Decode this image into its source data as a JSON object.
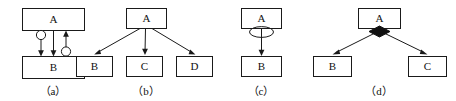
{
  "figure": {
    "background": "#ffffff",
    "stroke_color": "#1a1a1a",
    "fill_color": "#ffffff",
    "accent_color": "#111111",
    "width": 456,
    "height": 101
  },
  "panels": [
    {
      "id": "a",
      "caption": "（a）",
      "description": "Two boxes A and B connected by two opposing arrows, each carrying a small hollow circle",
      "boxes": [
        {
          "label": "A",
          "x": 22,
          "y": 8,
          "w": 62,
          "h": 22
        },
        {
          "label": "B",
          "x": 22,
          "y": 56,
          "w": 62,
          "h": 22
        }
      ],
      "edges": [
        {
          "from": "A",
          "to": "B",
          "marker": "hollow-circle",
          "direction": "down"
        },
        {
          "from": "B",
          "to": "A",
          "marker": "hollow-circle",
          "direction": "up"
        }
      ]
    },
    {
      "id": "b",
      "caption": "（b）",
      "description": "Box A branching with three arrows down to boxes B, C and D",
      "boxes": [
        {
          "label": "A",
          "x": 126,
          "y": 8,
          "w": 40,
          "h": 20
        },
        {
          "label": "B",
          "x": 76,
          "y": 56,
          "w": 36,
          "h": 20
        },
        {
          "label": "C",
          "x": 126,
          "y": 56,
          "w": 36,
          "h": 20
        },
        {
          "label": "D",
          "x": 176,
          "y": 56,
          "w": 36,
          "h": 20
        }
      ],
      "edges": [
        {
          "from": "A",
          "to": "B",
          "marker": "arrow",
          "direction": "down"
        },
        {
          "from": "A",
          "to": "C",
          "marker": "arrow",
          "direction": "down"
        },
        {
          "from": "A",
          "to": "D",
          "marker": "arrow",
          "direction": "down"
        }
      ]
    },
    {
      "id": "c",
      "caption": "（c）",
      "description": "Box A with a small ellipse on the link, arrow down to box B",
      "boxes": [
        {
          "label": "A",
          "x": 241,
          "y": 8,
          "w": 40,
          "h": 20
        },
        {
          "label": "B",
          "x": 241,
          "y": 56,
          "w": 40,
          "h": 20
        }
      ],
      "edges": [
        {
          "from": "A",
          "to": "B",
          "marker": "ellipse",
          "direction": "down"
        }
      ]
    },
    {
      "id": "d",
      "caption": "（d）",
      "description": "Box A with a solid black diamond branching to boxes B and C",
      "boxes": [
        {
          "label": "A",
          "x": 358,
          "y": 8,
          "w": 42,
          "h": 20
        },
        {
          "label": "B",
          "x": 313,
          "y": 56,
          "w": 38,
          "h": 20
        },
        {
          "label": "C",
          "x": 408,
          "y": 56,
          "w": 38,
          "h": 20
        }
      ],
      "edges": [
        {
          "from": "A",
          "to": "B",
          "marker": "solid-diamond",
          "direction": "down"
        },
        {
          "from": "A",
          "to": "C",
          "marker": "solid-diamond",
          "direction": "down"
        }
      ]
    }
  ]
}
